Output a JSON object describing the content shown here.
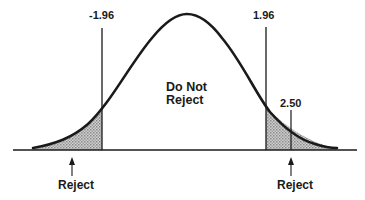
{
  "diagram": {
    "type": "two-tailed hypothesis test, normal distribution",
    "critical_values": {
      "left": "-1.96",
      "right": "1.96"
    },
    "test_statistic": "2.50",
    "center_region": {
      "line1": "Do Not",
      "line2": "Reject"
    },
    "reject_labels": {
      "left": "Reject",
      "right": "Reject"
    },
    "colors": {
      "stroke": "#1a1a1a",
      "shade": "#b8b8b8",
      "background": "#ffffff"
    }
  }
}
